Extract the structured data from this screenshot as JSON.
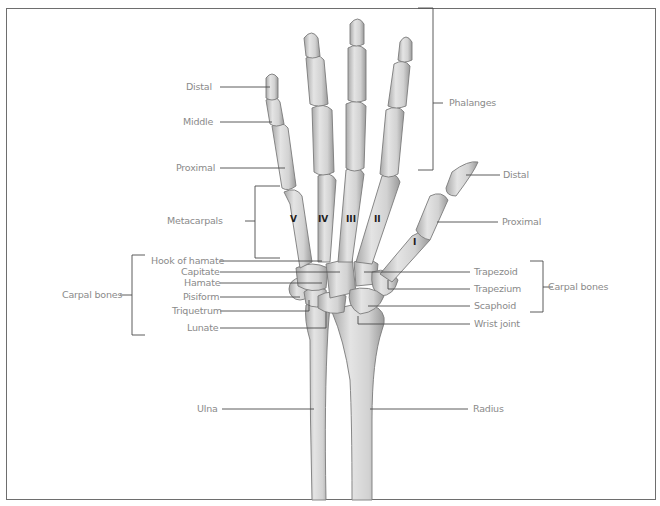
{
  "figure": {
    "colors": {
      "bone_fill": "#d9d9d9",
      "bone_stroke": "#7a7a7a",
      "leader_line": "#4a4a4a",
      "label_text": "#8a8a8a",
      "frame": "#6e6e6e"
    }
  },
  "labels": {
    "left": {
      "distal": "Distal",
      "middle": "Middle",
      "proximal": "Proximal",
      "metacarpals": "Metacarpals",
      "hook_of_hamate": "Hook of hamate",
      "capitate": "Capitate",
      "hamate": "Hamate",
      "pisiform": "Pisiform",
      "triquetrum": "Triquetrum",
      "lunate": "Lunate",
      "carpal_bones": "Carpal bones",
      "ulna": "Ulna"
    },
    "right": {
      "phalanges": "Phalanges",
      "thumb_distal": "Distal",
      "thumb_proximal": "Proximal",
      "trapezoid": "Trapezoid",
      "trapezium": "Trapezium",
      "scaphoid": "Scaphoid",
      "carpal_bones": "Carpal bones",
      "wrist_joint": "Wrist joint",
      "radius": "Radius"
    }
  },
  "metacarpal_numerals": [
    "V",
    "IV",
    "III",
    "II",
    "I"
  ]
}
